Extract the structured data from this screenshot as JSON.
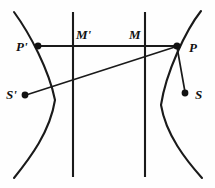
{
  "figure": {
    "type": "geometric-diagram",
    "width": 215,
    "height": 188,
    "background_color": "#fefefe",
    "ink_color": "#1a1a1a",
    "points": [
      {
        "id": "P-prime",
        "label": "P'",
        "x": 38,
        "y": 46,
        "label_x": 16,
        "label_y": 40,
        "dot": true
      },
      {
        "id": "M-prime",
        "label": "M'",
        "x": 73,
        "y": 46,
        "label_x": 76,
        "label_y": 28,
        "dot": false
      },
      {
        "id": "M",
        "label": "M",
        "x": 145,
        "y": 46,
        "label_x": 129,
        "label_y": 28,
        "dot": false
      },
      {
        "id": "P",
        "label": "P",
        "x": 177,
        "y": 46,
        "label_x": 189,
        "label_y": 41,
        "dot": true
      },
      {
        "id": "S-prime",
        "label": "S'",
        "x": 25,
        "y": 95,
        "label_x": 6,
        "label_y": 88,
        "dot": true
      },
      {
        "id": "S",
        "label": "S",
        "x": 185,
        "y": 93,
        "label_x": 195,
        "label_y": 88,
        "dot": true
      }
    ],
    "curves": [
      {
        "id": "left-branch",
        "name": "left-hyperbola-branch",
        "path": "M 14 12 C 30 34, 49 70, 55 100 C 50 132, 30 158, 14 178"
      },
      {
        "id": "right-branch",
        "name": "right-hyperbola-branch",
        "path": "M 201 11 C 186 30, 166 72, 161 105 C 166 135, 186 160, 202 178"
      }
    ],
    "vertical_lines": [
      {
        "id": "directrix-left",
        "name": "directrix-left-line",
        "x": 73,
        "y1": 12,
        "y2": 177
      },
      {
        "id": "directrix-right",
        "name": "directrix-right-line",
        "x": 145,
        "y1": 12,
        "y2": 177
      }
    ],
    "segments": [
      {
        "id": "PprimeP",
        "name": "horizontal-chord-P-prime-to-P",
        "x1": 37,
        "y1": 46,
        "x2": 178,
        "y2": 46
      },
      {
        "id": "SprimeP",
        "name": "focal-ray-S-prime-to-P",
        "x1": 26,
        "y1": 95,
        "x2": 178,
        "y2": 46
      },
      {
        "id": "PS",
        "name": "focal-ray-P-to-S",
        "x1": 177,
        "y1": 47,
        "x2": 185,
        "y2": 92
      }
    ],
    "labels_summary": [
      "P'",
      "M'",
      "M",
      "P",
      "S'",
      "S"
    ]
  }
}
